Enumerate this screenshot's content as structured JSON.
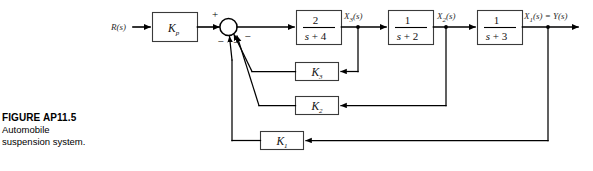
{
  "figure": {
    "caption_title": "FIGURE AP11.5",
    "caption_line1": "Automobile",
    "caption_line2": "suspension system."
  },
  "diagram": {
    "type": "control-system-block-diagram",
    "input_label": "R(s)",
    "output_label": "X₁(s) = Y(s)",
    "summing_junction": {
      "name": "summing-junction",
      "positive_sign": "+",
      "negative_signs": [
        "−",
        "−",
        "−"
      ],
      "inputs": [
        "R(s) via Kp",
        "K3 feedback",
        "K2 feedback",
        "K1 feedback"
      ]
    },
    "forward_blocks": [
      {
        "name": "gain-kp",
        "label": "K",
        "subscript": "p",
        "kind": "gain"
      },
      {
        "name": "transfer-function-1",
        "numerator": "2",
        "denominator_var": "s",
        "denominator_op": "+",
        "denominator_const": "4",
        "kind": "transfer-function"
      },
      {
        "name": "transfer-function-2",
        "numerator": "1",
        "denominator_var": "s",
        "denominator_op": "+",
        "denominator_const": "2",
        "kind": "transfer-function"
      },
      {
        "name": "transfer-function-3",
        "numerator": "1",
        "denominator_var": "s",
        "denominator_op": "+",
        "denominator_const": "3",
        "kind": "transfer-function"
      }
    ],
    "feedback_blocks": [
      {
        "name": "gain-k3",
        "label": "K",
        "subscript": "3",
        "kind": "gain",
        "tapped_from": "X₃(s)"
      },
      {
        "name": "gain-k2",
        "label": "K",
        "subscript": "2",
        "kind": "gain",
        "tapped_from": "X₂(s)"
      },
      {
        "name": "gain-k1",
        "label": "K",
        "subscript": "1",
        "kind": "gain",
        "tapped_from": "X₁(s) = Y(s)"
      }
    ],
    "signal_labels": [
      {
        "name": "signal-x3",
        "text": "X",
        "sub": "3",
        "suffix": "(s)"
      },
      {
        "name": "signal-x2",
        "text": "X",
        "sub": "2",
        "suffix": "(s)"
      },
      {
        "name": "signal-x1",
        "text": "X",
        "sub": "1",
        "suffix": "(s) = Y(s)"
      }
    ],
    "colors": {
      "wire": "#000000",
      "box_stroke": "#3a3a3a",
      "background": "#ffffff",
      "text": "#1a1a1a"
    }
  }
}
